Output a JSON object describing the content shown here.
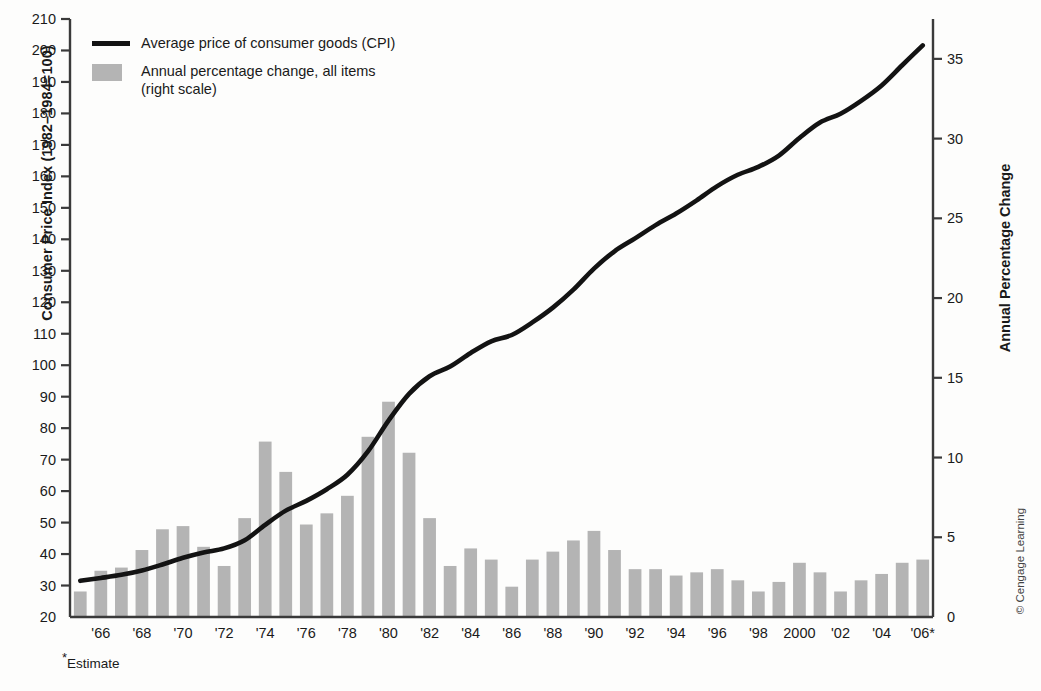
{
  "legend": {
    "line_label": "Average price of consumer goods (CPI)",
    "bar_label_1": "Annual percentage change, all items",
    "bar_label_2": "(right scale)"
  },
  "axes": {
    "left_title": "Consumer Price Index (1982–1984=100)",
    "right_title": "Annual Percentage Change",
    "left_ticks": [
      210,
      200,
      190,
      180,
      170,
      160,
      150,
      140,
      130,
      120,
      110,
      100,
      90,
      80,
      70,
      60,
      50,
      40,
      30,
      20
    ],
    "right_ticks": [
      35,
      30,
      25,
      20,
      15,
      10,
      5,
      0
    ],
    "x_ticks": [
      "'66",
      "'68",
      "'70",
      "'72",
      "'74",
      "'76",
      "'78",
      "'80",
      "'82",
      "'84",
      "'86",
      "'88",
      "'90",
      "'92",
      "'94",
      "'96",
      "'98",
      "2000",
      "'02",
      "'04",
      "'06*"
    ]
  },
  "footnote": "Estimate",
  "credit": "© Cengage Learning",
  "colors": {
    "bar": "#b4b4b4",
    "line": "#131313",
    "axis": "#3a3a3a",
    "background": "#fdfdfc"
  },
  "chart_data": {
    "type": "bar",
    "title": "",
    "xlabel": "",
    "ylabel": "Consumer Price Index (1982–1984=100)",
    "ylabel_right": "Annual Percentage Change",
    "ylim": [
      20,
      210
    ],
    "ylim_right": [
      0,
      37.5
    ],
    "grid": false,
    "legend_position": "top-left",
    "categories": [
      "1965",
      "1966",
      "1967",
      "1968",
      "1969",
      "1970",
      "1971",
      "1972",
      "1973",
      "1974",
      "1975",
      "1976",
      "1977",
      "1978",
      "1979",
      "1980",
      "1981",
      "1982",
      "1983",
      "1984",
      "1985",
      "1986",
      "1987",
      "1988",
      "1989",
      "1990",
      "1991",
      "1992",
      "1993",
      "1994",
      "1995",
      "1996",
      "1997",
      "1998",
      "1999",
      "2000",
      "2001",
      "2002",
      "2003",
      "2004",
      "2005",
      "2006"
    ],
    "series": [
      {
        "name": "Annual percentage change, all items (right scale)",
        "type": "bar",
        "axis": "right",
        "unit": "%",
        "values": [
          1.6,
          2.9,
          3.1,
          4.2,
          5.5,
          5.7,
          4.4,
          3.2,
          6.2,
          11.0,
          9.1,
          5.8,
          6.5,
          7.6,
          11.3,
          13.5,
          10.3,
          6.2,
          3.2,
          4.3,
          3.6,
          1.9,
          3.6,
          4.1,
          4.8,
          5.4,
          4.2,
          3.0,
          3.0,
          2.6,
          2.8,
          3.0,
          2.3,
          1.6,
          2.2,
          3.4,
          2.8,
          1.6,
          2.3,
          2.7,
          3.4,
          3.6
        ]
      },
      {
        "name": "Average price of consumer goods (CPI)",
        "type": "line",
        "axis": "left",
        "unit": "index",
        "values": [
          31.5,
          32.4,
          33.4,
          34.8,
          36.7,
          38.8,
          40.5,
          41.8,
          44.4,
          49.3,
          53.8,
          56.9,
          60.6,
          65.2,
          72.6,
          82.4,
          90.9,
          96.5,
          99.6,
          103.9,
          107.6,
          109.6,
          113.6,
          118.3,
          124.0,
          130.7,
          136.2,
          140.3,
          144.5,
          148.2,
          152.4,
          156.9,
          160.5,
          163.0,
          166.6,
          172.2,
          177.1,
          179.9,
          184.0,
          188.9,
          195.3,
          201.6
        ]
      }
    ],
    "annotations": [
      "*Estimate",
      "© Cengage Learning"
    ]
  }
}
